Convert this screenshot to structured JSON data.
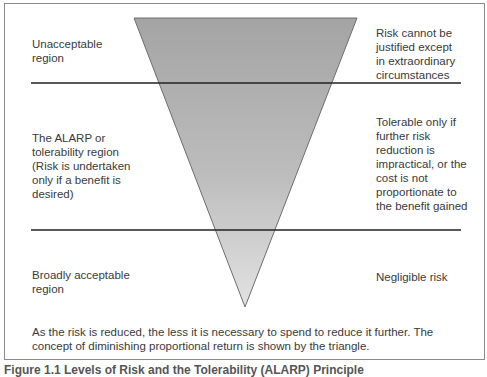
{
  "diagram": {
    "regions": [
      {
        "name": "unacceptable",
        "left_label": "Unacceptable\nregion",
        "right_label": "Risk cannot be\njustified except\nin extraordinary\ncircumstances"
      },
      {
        "name": "alarp",
        "left_label": "The ALARP or\ntolerability region\n(Risk is undertaken\nonly if a benefit is\ndesired)",
        "right_label": "Tolerable only if\nfurther risk\nreduction is\nimpractical, or the\ncost is not\nproportionate to\nthe benefit gained"
      },
      {
        "name": "broadly-acceptable",
        "left_label": "Broadly acceptable\nregion",
        "right_label": "Negligible risk"
      }
    ],
    "note": "As the risk is reduced, the less it is necessary to spend to reduce it further. The concept of diminishing proportional return is shown by the triangle.",
    "caption": "Figure 1.1  Levels of Risk and the Tolerability (ALARP) Principle",
    "colors": {
      "triangle_top": "#a6a6a6",
      "triangle_bottom": "#dedede",
      "divider": "#222222",
      "border": "#8a8a8a"
    }
  }
}
